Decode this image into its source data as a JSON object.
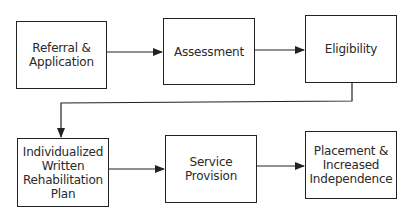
{
  "diagram": {
    "type": "flowchart",
    "nodes": [
      {
        "id": "referral",
        "label": "Referral &\nApplication"
      },
      {
        "id": "assessment",
        "label": "Assessment"
      },
      {
        "id": "eligibility",
        "label": "Eligibility"
      },
      {
        "id": "iwrp",
        "label": "Individualized\nWritten\nRehabilitation\nPlan"
      },
      {
        "id": "service",
        "label": "Service\nProvision"
      },
      {
        "id": "placement",
        "label": "Placement &\nIncreased\nIndependence"
      }
    ],
    "edges": [
      {
        "from": "referral",
        "to": "assessment"
      },
      {
        "from": "assessment",
        "to": "eligibility"
      },
      {
        "from": "eligibility",
        "to": "iwrp"
      },
      {
        "from": "iwrp",
        "to": "service"
      },
      {
        "from": "service",
        "to": "placement"
      }
    ],
    "colors": {
      "line": "#222222",
      "background": "#ffffff",
      "text": "#2a2a2a"
    }
  }
}
